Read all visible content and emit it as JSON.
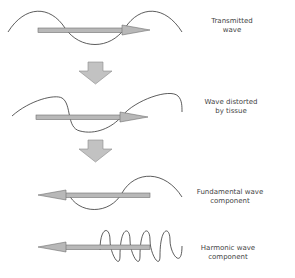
{
  "figure": {
    "colors": {
      "background": "#ffffff",
      "wave_stroke": "#333333",
      "arrow_fill": "#b8b8b8",
      "arrow_stroke": "#6e6e6e",
      "down_arrow_fill": "#c2c2c2",
      "label_text": "#444444"
    },
    "stages": [
      {
        "id": "transmitted",
        "label_lines": [
          "Transmitted",
          "wave"
        ],
        "arrow_direction": "right",
        "wave_type": "sine-one-cycle"
      },
      {
        "id": "distorted",
        "label_lines": [
          "Wave distorted",
          "by tissue"
        ],
        "arrow_direction": "right",
        "wave_type": "distorted"
      },
      {
        "id": "fundamental",
        "label_lines": [
          "Fundamental wave",
          "component"
        ],
        "arrow_direction": "left",
        "wave_type": "sine-one-cycle"
      },
      {
        "id": "harmonic",
        "label_lines": [
          "Harmonic wave",
          "component"
        ],
        "arrow_direction": "left",
        "wave_type": "sine-three-cycles"
      }
    ],
    "transition_arrows": [
      {
        "from": "transmitted",
        "to": "distorted",
        "direction": "down"
      },
      {
        "from": "distorted",
        "to": "fundamental",
        "direction": "down"
      }
    ]
  }
}
